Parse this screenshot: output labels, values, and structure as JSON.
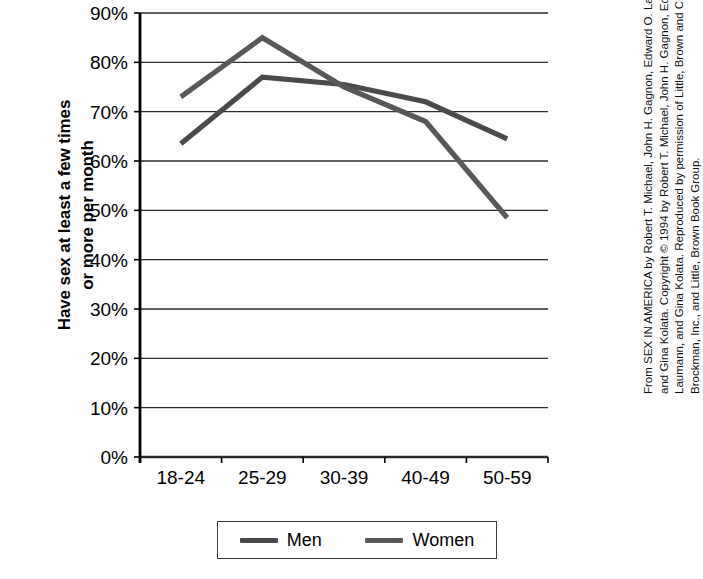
{
  "chart_data": {
    "type": "line",
    "title": "",
    "ylabel": "Have sex at least a few times or more per month",
    "xlabel": "",
    "categories": [
      "18-24",
      "25-29",
      "30-39",
      "40-49",
      "50-59"
    ],
    "series": [
      {
        "name": "Men",
        "values": [
          63.5,
          77.0,
          75.5,
          72.0,
          64.5
        ],
        "color": "#4a4a4a"
      },
      {
        "name": "Women",
        "values": [
          73.0,
          85.0,
          75.0,
          68.0,
          48.5
        ],
        "color": "#585858"
      }
    ],
    "ylim": [
      0,
      90
    ],
    "ytick_values": [
      0,
      10,
      20,
      30,
      40,
      50,
      60,
      70,
      80,
      90
    ],
    "ytick_labels": [
      "0%",
      "10%",
      "20%",
      "30%",
      "40%",
      "50%",
      "60%",
      "70%",
      "80%",
      "90%"
    ],
    "grid": true,
    "legend_position": "bottom"
  },
  "axis": {
    "y_title_line1": "Have sex at least a few times",
    "y_title_line2": "or more per month"
  },
  "legend": {
    "items": [
      {
        "label": "Men"
      },
      {
        "label": "Women"
      }
    ]
  },
  "credit": {
    "lines": [
      "From SEX IN AMERICA by Robert T. Michael, John H. Gagnon, Edward O. Laumann,",
      "and Gina Kolata. Copyright © 1994 by Robert T. Michael, John H. Gagnon, Edward O.",
      "Laumann, and Gina Kolata. Reproduced by permission of Little, Brown and Company;",
      "Brockman, Inc., and Little, Brown Book Group."
    ]
  },
  "colors": {
    "axis": "#000000",
    "grid": "#2b2b2b",
    "men_line": "#4a4a4a",
    "women_line": "#585858",
    "background": "#ffffff"
  }
}
